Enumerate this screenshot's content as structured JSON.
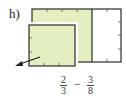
{
  "problem": {
    "label": "h)",
    "expression": {
      "left": {
        "numerator": "2",
        "denominator": "3"
      },
      "operator": "−",
      "right": {
        "numerator": "3",
        "denominator": "8"
      }
    }
  },
  "figure": {
    "outer_rect": {
      "parts": 3,
      "shaded_parts": 2,
      "fill": "#e3efc0",
      "stroke": "#2b2b2b"
    },
    "removed_piece": {
      "fill": "#e3efc0",
      "stroke": "#2b2b2b",
      "description": "shaded piece pulled out with arrow"
    },
    "arrow_direction": "down-left"
  }
}
